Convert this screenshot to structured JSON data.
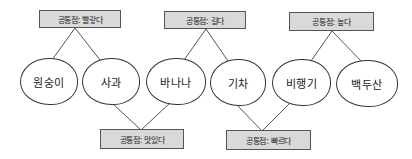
{
  "diagram": {
    "type": "grouping-diagram",
    "nodes": [
      {
        "id": "n1",
        "label": "원숭이"
      },
      {
        "id": "n2",
        "label": "사과"
      },
      {
        "id": "n3",
        "label": "바나나"
      },
      {
        "id": "n4",
        "label": "기차"
      },
      {
        "id": "n5",
        "label": "비행기"
      },
      {
        "id": "n6",
        "label": "백두산"
      }
    ],
    "top_groups": [
      {
        "label": "공통점: 빨갛다",
        "connects": [
          "n1",
          "n2"
        ]
      },
      {
        "label": "공통점: 길다",
        "connects": [
          "n3",
          "n4"
        ]
      },
      {
        "label": "공통점: 높다",
        "connects": [
          "n5",
          "n6"
        ]
      }
    ],
    "bottom_groups": [
      {
        "label": "공통점: 맛있다",
        "connects": [
          "n2",
          "n3"
        ]
      },
      {
        "label": "공통점: 빠르다",
        "connects": [
          "n4",
          "n5"
        ]
      }
    ],
    "colors": {
      "box_fill": "#d9d9d9",
      "box_border": "#555555",
      "line": "#555555",
      "node_border": "#333333"
    }
  }
}
